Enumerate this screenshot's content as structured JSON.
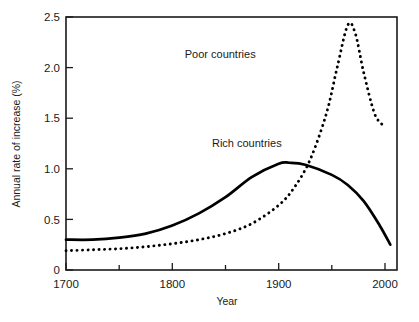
{
  "chart_data": {
    "type": "line",
    "title": "",
    "xlabel": "Year",
    "ylabel": "Annual rate of increase (%)",
    "xlim": [
      1700,
      2010
    ],
    "ylim": [
      0,
      2.5
    ],
    "grid": false,
    "legend": "inline-annotations",
    "x_ticks_major": [
      1700,
      1800,
      1900,
      2000
    ],
    "x_tick_labels": [
      "1700",
      "1800",
      "1900",
      "2000"
    ],
    "x_ticks_minor": [
      1750,
      1850,
      1950
    ],
    "y_ticks": [
      0,
      0.5,
      1.0,
      1.5,
      2.0,
      2.5
    ],
    "y_tick_labels": [
      "0",
      "0.5",
      "1.0",
      "1.5",
      "2.0",
      "2.5"
    ],
    "series": [
      {
        "name": "Rich countries",
        "style": "solid",
        "color": "#000000",
        "label_x": 1870,
        "label_y": 1.22,
        "x": [
          1700,
          1725,
          1750,
          1775,
          1800,
          1825,
          1850,
          1875,
          1900,
          1910,
          1925,
          1950,
          1965,
          1980,
          1995,
          2005
        ],
        "y": [
          0.3,
          0.3,
          0.32,
          0.36,
          0.44,
          0.56,
          0.72,
          0.92,
          1.05,
          1.06,
          1.04,
          0.94,
          0.84,
          0.68,
          0.44,
          0.25
        ]
      },
      {
        "name": "Poor countries",
        "style": "dotted",
        "color": "#000000",
        "label_x": 1845,
        "label_y": 2.1,
        "x": [
          1700,
          1725,
          1750,
          1775,
          1800,
          1825,
          1850,
          1875,
          1900,
          1915,
          1930,
          1945,
          1955,
          1965,
          1972,
          1980,
          1990,
          1998
        ],
        "y": [
          0.19,
          0.2,
          0.21,
          0.23,
          0.26,
          0.3,
          0.36,
          0.46,
          0.64,
          0.82,
          1.1,
          1.55,
          2.0,
          2.42,
          2.34,
          1.95,
          1.55,
          1.43
        ]
      }
    ]
  },
  "axes": {
    "y_title": "Annual rate of increase (%)",
    "x_title": "Year"
  },
  "labels": {
    "poor": "Poor countries",
    "rich": "Rich countries"
  },
  "y_tick_text": {
    "t0": "0",
    "t1": "0.5",
    "t2": "1.0",
    "t3": "1.5",
    "t4": "2.0",
    "t5": "2.5"
  },
  "x_tick_text": {
    "t0": "1700",
    "t1": "1800",
    "t2": "1900",
    "t3": "2000"
  }
}
